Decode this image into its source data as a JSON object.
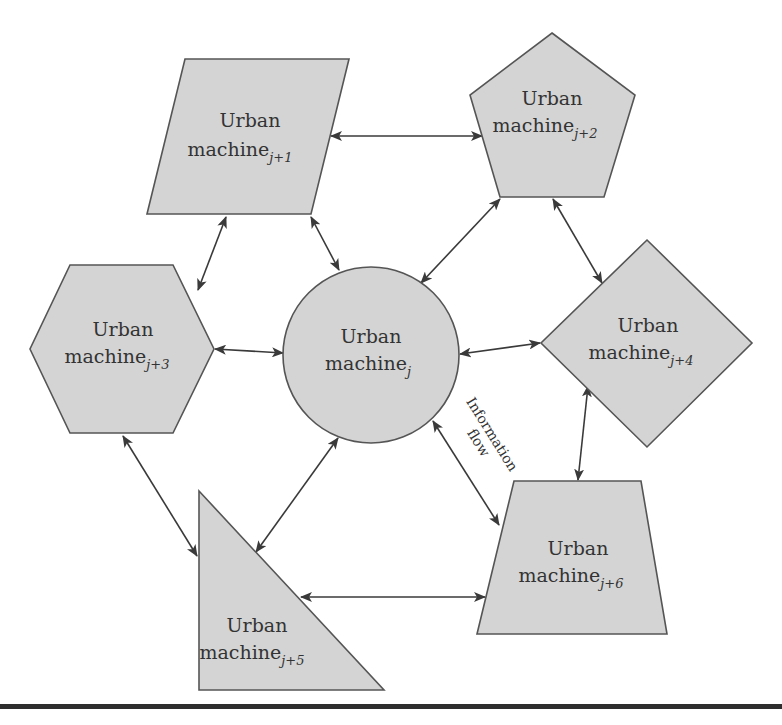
{
  "diagram": {
    "type": "network",
    "nodes": [
      {
        "id": "j",
        "shape": "circle",
        "line1": "Urban",
        "line2": "machine",
        "subscript": "j"
      },
      {
        "id": "j+1",
        "shape": "parallelogram",
        "line1": "Urban",
        "line2": "machine",
        "subscript": "j+1"
      },
      {
        "id": "j+2",
        "shape": "pentagon",
        "line1": "Urban",
        "line2": "machine",
        "subscript": "j+2"
      },
      {
        "id": "j+3",
        "shape": "hexagon",
        "line1": "Urban",
        "line2": "machine",
        "subscript": "j+3"
      },
      {
        "id": "j+4",
        "shape": "diamond",
        "line1": "Urban",
        "line2": "machine",
        "subscript": "j+4"
      },
      {
        "id": "j+5",
        "shape": "right-triangle",
        "line1": "Urban",
        "line2": "machine",
        "subscript": "j+5"
      },
      {
        "id": "j+6",
        "shape": "trapezoid",
        "line1": "Urban",
        "line2": "machine",
        "subscript": "j+6"
      }
    ],
    "edges": [
      {
        "from": "j+1",
        "to": "j+2",
        "direction": "bidirectional"
      },
      {
        "from": "j+1",
        "to": "j",
        "direction": "bidirectional"
      },
      {
        "from": "j+1",
        "to": "j+3",
        "direction": "bidirectional"
      },
      {
        "from": "j+2",
        "to": "j",
        "direction": "bidirectional"
      },
      {
        "from": "j+2",
        "to": "j+4",
        "direction": "bidirectional"
      },
      {
        "from": "j+3",
        "to": "j",
        "direction": "bidirectional"
      },
      {
        "from": "j+4",
        "to": "j",
        "direction": "bidirectional"
      },
      {
        "from": "j+3",
        "to": "j+5",
        "direction": "bidirectional"
      },
      {
        "from": "j+5",
        "to": "j",
        "direction": "bidirectional"
      },
      {
        "from": "j+4",
        "to": "j+6",
        "direction": "bidirectional"
      },
      {
        "from": "j",
        "to": "j+6",
        "direction": "bidirectional"
      },
      {
        "from": "j+5",
        "to": "j+6",
        "direction": "bidirectional"
      }
    ],
    "annotation": {
      "line1": "Information",
      "line2": "flow"
    },
    "colors": {
      "fill": "#d4d4d4",
      "stroke": "#555555",
      "arrow": "#3a3a3a",
      "rule": "#2e2e2e"
    }
  }
}
